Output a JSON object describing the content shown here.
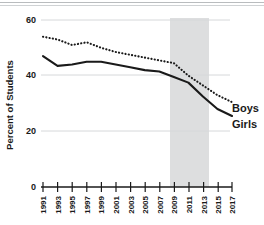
{
  "chart_data": {
    "type": "line",
    "title": "",
    "xlabel": "",
    "ylabel": "Percent of Students",
    "ylim": [
      0,
      60
    ],
    "yticks": [
      0,
      20,
      40,
      60
    ],
    "ytick_labels": [
      "0",
      "20",
      "40",
      "60"
    ],
    "grid": "horizontal",
    "legend_position": "right-inline",
    "x": [
      1991,
      1993,
      1995,
      1997,
      1999,
      2001,
      2003,
      2005,
      2007,
      2009,
      2011,
      2013,
      2015,
      2017
    ],
    "xtick_labels": [
      "1991",
      "1993",
      "1995",
      "1997",
      "1999",
      "2001",
      "2003",
      "2005",
      "2007",
      "2009",
      "2011",
      "2013",
      "2015",
      "2017"
    ],
    "series": [
      {
        "name": "Boys",
        "style": "dotted",
        "color": "#1a1a1a",
        "values": [
          54.0,
          53.0,
          51.0,
          52.0,
          50.0,
          48.5,
          47.5,
          46.5,
          45.5,
          44.5,
          40.0,
          36.5,
          33.0,
          30.5
        ]
      },
      {
        "name": "Girls",
        "style": "solid",
        "color": "#1a1a1a",
        "values": [
          47.0,
          43.5,
          44.0,
          45.0,
          45.0,
          44.0,
          43.0,
          42.0,
          41.5,
          39.5,
          37.5,
          32.5,
          28.0,
          25.5
        ]
      }
    ],
    "shaded_band": {
      "label": "",
      "x_start": 2010,
      "x_end": 2015,
      "color": "#dddedf"
    },
    "annotations": [
      {
        "text": "Boys",
        "x": 2017,
        "y": 30.5
      },
      {
        "text": "Girls",
        "x": 2017,
        "y": 25.5
      }
    ]
  },
  "axes": {
    "y_title": "Percent of Students"
  },
  "legend": {
    "boys_label": "Boys",
    "girls_label": "Girls"
  }
}
